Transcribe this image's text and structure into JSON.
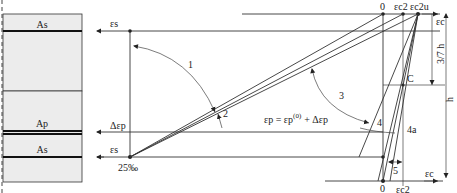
{
  "diagram": {
    "section": {
      "labels": {
        "as_top": "As",
        "ap": "Ap",
        "as_bottom": "As"
      },
      "fill": "#ececec",
      "border": "#333333"
    },
    "strain_labels": {
      "eps_s_top": "εs",
      "delta_eps_p": "Δεp",
      "eps_s_bottom": "εs",
      "limit_steel": "25‰",
      "zero_top": "0",
      "eps_c2_top": "εc2",
      "eps_c2u": "εc2u",
      "eps_c_top": "εc",
      "three_seventh_h": "3/7 h",
      "h": "h",
      "point_c": "C",
      "eps_c_bottom": "εc",
      "zero_bottom": "0",
      "eps_c2_bottom": "εc2",
      "prestress_eq_lhs": "εp = εp",
      "prestress_eq_sup": "(0)",
      "prestress_eq_rhs": "+ Δεp"
    },
    "domains": {
      "d1": "1",
      "d2": "2",
      "d3": "3",
      "d4": "4",
      "d4a": "4a",
      "d5": "5"
    }
  }
}
